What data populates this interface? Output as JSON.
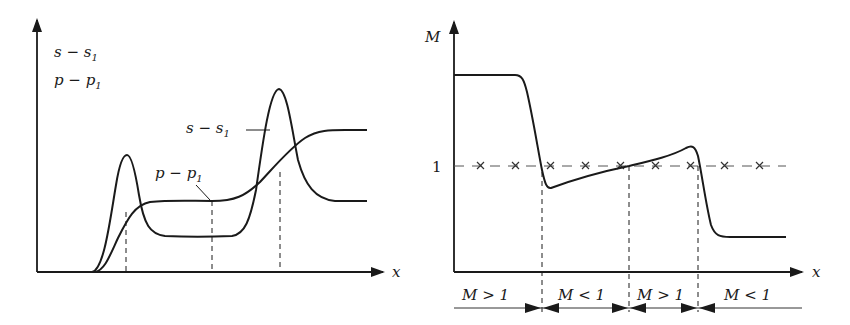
{
  "left_panel": {
    "y_axis_labels": [
      "s − s",
      "p − p"
    ],
    "y_axis_subscripts": [
      "1",
      "1"
    ],
    "x_axis_label": "x",
    "curve_labels": {
      "s_curve": "s − s",
      "s_curve_sub": "1",
      "p_curve": "p − p",
      "p_curve_sub": "1"
    },
    "dashed_markers_x": [
      126,
      212,
      280
    ]
  },
  "right_panel": {
    "y_axis_label": "M",
    "y_tick_label": "1",
    "x_axis_label": "x",
    "regions": [
      {
        "label": "M > 1"
      },
      {
        "label": "M < 1"
      },
      {
        "label": "M > 1"
      },
      {
        "label": "M < 1"
      }
    ],
    "dashed_markers_x": [
      542,
      629,
      698
    ]
  },
  "colors": {
    "ink": "#1a1a1a",
    "background": "#ffffff"
  }
}
